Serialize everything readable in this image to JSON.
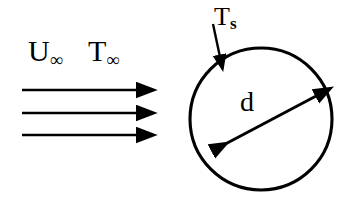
{
  "diagram": {
    "background_color": "#ffffff",
    "stroke_color": "#000000",
    "labels": {
      "free_stream_velocity": {
        "symbol": "U",
        "subscript": "∞",
        "name": "free-stream velocity"
      },
      "free_stream_temperature": {
        "symbol": "T",
        "subscript": "∞",
        "name": "free-stream temperature"
      },
      "surface_temperature": {
        "symbol": "T",
        "subscript": "s",
        "name": "surface temperature"
      },
      "diameter": {
        "symbol": "d",
        "name": "cylinder diameter"
      }
    },
    "flow_arrows": {
      "count": 3,
      "direction": "right",
      "y_positions": [
        90,
        113,
        135
      ],
      "x_start": 22,
      "x_end": 148
    },
    "cylinder": {
      "shape": "circle",
      "center_x": 261,
      "center_y": 119,
      "radius": 71
    },
    "diameter_arrow": {
      "style": "double-headed",
      "from_x": 209,
      "from_y": 153,
      "to_x": 323,
      "to_y": 92
    },
    "surface_pointer": {
      "style": "single-headed",
      "from_x": 214,
      "from_y": 25,
      "to_x": 221,
      "to_y": 63
    }
  }
}
